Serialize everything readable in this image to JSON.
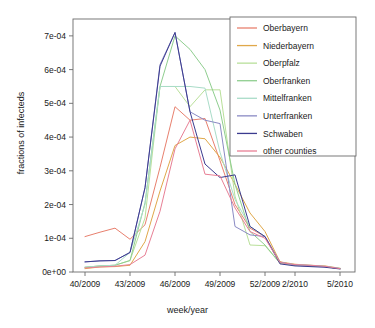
{
  "chart_data": {
    "type": "line",
    "title": "",
    "xlabel": "week/year",
    "ylabel": "fractions of infecteds",
    "grid": false,
    "legend_position": "top-right",
    "x": [
      40,
      41,
      42,
      43,
      44,
      45,
      46,
      47,
      48,
      49,
      50,
      51,
      52,
      1,
      2,
      3,
      4,
      5
    ],
    "xtick_positions": [
      40,
      43,
      46,
      49,
      52,
      54,
      57
    ],
    "xtick_labels": [
      "40/2009",
      "43/2009",
      "46/2009",
      "49/2009",
      "52/2009",
      "2/2010",
      "5/2010"
    ],
    "ytick_values": [
      0,
      0.0001,
      0.0002,
      0.0003,
      0.0004,
      0.0005,
      0.0006,
      0.0007
    ],
    "ytick_labels": [
      "0e+00",
      "1e-04",
      "2e-04",
      "3e-04",
      "4e-04",
      "5e-04",
      "6e-04",
      "7e-04"
    ],
    "xlim": [
      39.2,
      58.0
    ],
    "ylim": [
      0,
      0.00075
    ],
    "series": [
      {
        "name": "Oberbayern",
        "color": "#e8806e",
        "values": [
          0.000105,
          0.000118,
          0.00013,
          9.7e-05,
          0.00014,
          0.00031,
          0.00049,
          0.00045,
          0.000455,
          0.00033,
          0.0002,
          0.00013,
          0.000105,
          3e-05,
          2e-05,
          1.8e-05,
          1.6e-05,
          1e-05
        ]
      },
      {
        "name": "Niederbayern",
        "color": "#e0a84a",
        "values": [
          1e-05,
          1.5e-05,
          1.6e-05,
          2e-05,
          9e-05,
          0.00024,
          0.000375,
          0.0004,
          0.000395,
          0.00034,
          0.00026,
          0.000175,
          0.00012,
          3e-05,
          2.3e-05,
          2e-05,
          1.8e-05,
          1.1e-05
        ]
      },
      {
        "name": "Oberpfalz",
        "color": "#b9e09a",
        "values": [
          1.4e-05,
          1.8e-05,
          2e-05,
          3.4e-05,
          0.00016,
          0.00055,
          0.00055,
          0.00049,
          0.00054,
          0.00054,
          0.000225,
          8e-05,
          7.8e-05,
          2.6e-05,
          2e-05,
          1.8e-05,
          1.6e-05,
          1e-05
        ]
      },
      {
        "name": "Oberfranken",
        "color": "#8fce8f",
        "values": [
          1.4e-05,
          1.8e-05,
          2e-05,
          3.4e-05,
          0.000205,
          0.00055,
          0.0007,
          0.00066,
          0.0006,
          0.00048,
          0.00026,
          0.00012,
          8e-05,
          2.6e-05,
          2.1e-05,
          1.9e-05,
          1.6e-05,
          1e-05
        ]
      },
      {
        "name": "Mittelfranken",
        "color": "#a9dcc8",
        "values": [
          1.4e-05,
          1.8e-05,
          2e-05,
          5.8e-05,
          0.0002,
          0.00055,
          0.00055,
          0.00055,
          0.000545,
          0.000355,
          0.000215,
          0.000135,
          0.000105,
          2.8e-05,
          2.2e-05,
          2e-05,
          1.7e-05,
          1.1e-05
        ]
      },
      {
        "name": "Unterfranken",
        "color": "#8a8ac4",
        "values": [
          3e-05,
          3.3e-05,
          3.4e-05,
          5.8e-05,
          0.00025,
          0.000615,
          0.00071,
          0.000475,
          0.00045,
          0.00044,
          0.000135,
          0.00011,
          0.000105,
          2.9e-05,
          2.1e-05,
          1.9e-05,
          1.6e-05,
          1e-05
        ]
      },
      {
        "name": "Schwaben",
        "color": "#3b3b8f",
        "values": [
          3e-05,
          3.3e-05,
          3.4e-05,
          5.8e-05,
          0.00025,
          0.00061,
          0.00071,
          0.000475,
          0.00032,
          0.00028,
          0.000288,
          0.000135,
          0.000105,
          2.4e-05,
          1.8e-05,
          1.6e-05,
          1.4e-05,
          9e-06
        ]
      },
      {
        "name": "other counties",
        "color": "#e87f95",
        "values": [
          1.2e-05,
          1.5e-05,
          1.7e-05,
          2.2e-05,
          5e-05,
          0.00018,
          0.000365,
          0.00045,
          0.00029,
          0.000285,
          0.00019,
          0.00012,
          0.0001,
          2.8e-05,
          2.2e-05,
          2e-05,
          1.7e-05,
          1e-05
        ]
      }
    ]
  },
  "axes": {
    "y_title": "fractions of infecteds",
    "x_title": "week/year"
  }
}
